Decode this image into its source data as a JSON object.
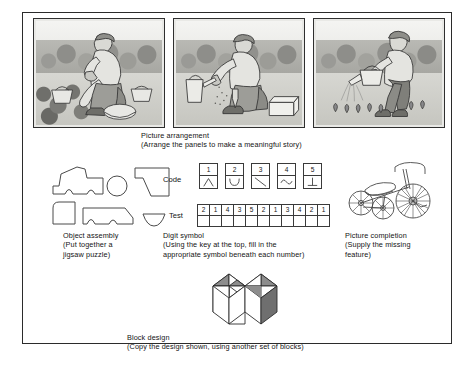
{
  "figure": {
    "title_hidden": "",
    "background_color": "#ffffff",
    "border_color": "#2b2b2b"
  },
  "picture_arrangement": {
    "caption_title": "Picture arrangement",
    "caption_detail": "(Arrange the panels to make a meaningful story)",
    "caption_full": "Picture arrangement\n(Arrange the panels to make a meaningful story)",
    "panels": [
      {
        "index": 1,
        "name": "panel-harvesting",
        "alt": "Man kneeling in a garden bed picking produce, baskets and a bowl beside him"
      },
      {
        "index": 2,
        "name": "panel-sowing",
        "alt": "Man kneeling on bare soil scattering seeds by hand, watering can and seed box nearby"
      },
      {
        "index": 3,
        "name": "panel-watering",
        "alt": "Man standing and watering a row of young seedlings with a watering can"
      }
    ]
  },
  "object_assembly": {
    "caption_title": "Object assembly",
    "caption_detail": "(Put together a\njigsaw puzzle)",
    "caption_full": "Object assembly\n(Put together a\njigsaw puzzle)",
    "pieces": [
      {
        "name": "piece-tractor-body",
        "shape": "irregular-tractor-silhouette"
      },
      {
        "name": "piece-wheel-circle",
        "shape": "circle"
      },
      {
        "name": "piece-hood-wedge",
        "shape": "angled-wedge"
      },
      {
        "name": "piece-cab-corner",
        "shape": "rounded-corner-square"
      },
      {
        "name": "piece-chassis",
        "shape": "long-body-with-notch"
      },
      {
        "name": "piece-small-bowl",
        "shape": "half-disc"
      }
    ]
  },
  "digit_symbol": {
    "caption_title": "Digit symbol",
    "caption_detail": "(Using the key at the top, fill in the\nappropriate symbol beneath each number)",
    "caption_full": "Digit symbol\n(Using the key at the top, fill in the\nappropriate symbol beneath each number)",
    "code_label": "Code",
    "test_label": "Test",
    "code_key": [
      {
        "digit": "1",
        "symbol_name": "caret-symbol",
        "symbol_glyph": "∧"
      },
      {
        "digit": "2",
        "symbol_name": "cup-symbol",
        "symbol_glyph": "∪"
      },
      {
        "digit": "3",
        "symbol_name": "backslash-symbol",
        "symbol_glyph": "\\"
      },
      {
        "digit": "4",
        "symbol_name": "wave-symbol",
        "symbol_glyph": "∿"
      },
      {
        "digit": "5",
        "symbol_name": "tee-symbol",
        "symbol_glyph": "⊥"
      }
    ],
    "test_digits": [
      "2",
      "1",
      "4",
      "3",
      "5",
      "2",
      "1",
      "3",
      "4",
      "2",
      "1"
    ]
  },
  "picture_completion": {
    "caption_title": "Picture completion",
    "caption_detail": "(Supply the missing\nfeature)",
    "caption_full": "Picture completion\n(Supply the missing\nfeature)",
    "drawing_alt": "Line drawing of a child's tricycle seen from the side"
  },
  "block_design": {
    "caption_title": "Block design",
    "caption_detail": "(Copy the design shown, using another set of blocks)",
    "caption_full": "Block design\n(Copy the design shown, using another set of blocks)",
    "drawing_alt": "Four cubes arranged in a block with shaded triangular pattern on the top faces"
  }
}
